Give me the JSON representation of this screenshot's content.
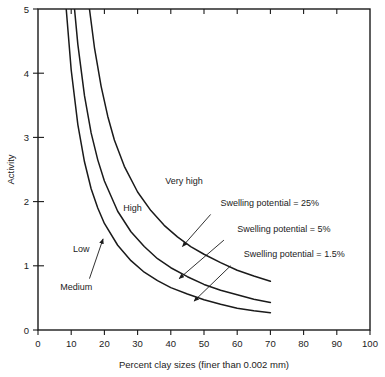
{
  "chart_data": {
    "type": "line",
    "title": "",
    "xlabel": "Percent clay sizes (finer than 0.002 mm)",
    "ylabel": "Activity",
    "xlim": [
      0,
      100
    ],
    "ylim": [
      0,
      5
    ],
    "xticks": [
      0,
      10,
      20,
      30,
      40,
      50,
      60,
      70,
      80,
      90,
      100
    ],
    "yticks": [
      0,
      1,
      2,
      3,
      4,
      5
    ],
    "grid": false,
    "legend_position": "none",
    "series": [
      {
        "name": "Swelling potential = 25%",
        "points": [
          {
            "x": 8.5,
            "y": 5.0
          },
          {
            "x": 10,
            "y": 4.05
          },
          {
            "x": 12,
            "y": 3.2
          },
          {
            "x": 14,
            "y": 2.62
          },
          {
            "x": 16,
            "y": 2.2
          },
          {
            "x": 18,
            "y": 1.9
          },
          {
            "x": 20,
            "y": 1.66
          },
          {
            "x": 24,
            "y": 1.32
          },
          {
            "x": 28,
            "y": 1.08
          },
          {
            "x": 32,
            "y": 0.9
          },
          {
            "x": 36,
            "y": 0.77
          },
          {
            "x": 40,
            "y": 0.66
          },
          {
            "x": 45,
            "y": 0.56
          },
          {
            "x": 50,
            "y": 0.47
          },
          {
            "x": 55,
            "y": 0.4
          },
          {
            "x": 60,
            "y": 0.34
          },
          {
            "x": 65,
            "y": 0.3
          },
          {
            "x": 70,
            "y": 0.27
          }
        ]
      },
      {
        "name": "Swelling potential = 5%",
        "points": [
          {
            "x": 11,
            "y": 5.0
          },
          {
            "x": 12,
            "y": 4.45
          },
          {
            "x": 14,
            "y": 3.65
          },
          {
            "x": 16,
            "y": 3.07
          },
          {
            "x": 18,
            "y": 2.65
          },
          {
            "x": 20,
            "y": 2.32
          },
          {
            "x": 24,
            "y": 1.85
          },
          {
            "x": 28,
            "y": 1.53
          },
          {
            "x": 32,
            "y": 1.3
          },
          {
            "x": 36,
            "y": 1.11
          },
          {
            "x": 40,
            "y": 0.97
          },
          {
            "x": 45,
            "y": 0.83
          },
          {
            "x": 50,
            "y": 0.71
          },
          {
            "x": 55,
            "y": 0.62
          },
          {
            "x": 60,
            "y": 0.55
          },
          {
            "x": 65,
            "y": 0.48
          },
          {
            "x": 70,
            "y": 0.43
          }
        ]
      },
      {
        "name": "Swelling potential = 1.5%",
        "points": [
          {
            "x": 15.5,
            "y": 5.0
          },
          {
            "x": 17,
            "y": 4.4
          },
          {
            "x": 19,
            "y": 3.8
          },
          {
            "x": 21,
            "y": 3.33
          },
          {
            "x": 23,
            "y": 2.96
          },
          {
            "x": 26,
            "y": 2.55
          },
          {
            "x": 30,
            "y": 2.15
          },
          {
            "x": 34,
            "y": 1.86
          },
          {
            "x": 38,
            "y": 1.63
          },
          {
            "x": 42,
            "y": 1.45
          },
          {
            "x": 46,
            "y": 1.3
          },
          {
            "x": 50,
            "y": 1.18
          },
          {
            "x": 55,
            "y": 1.05
          },
          {
            "x": 60,
            "y": 0.93
          },
          {
            "x": 65,
            "y": 0.84
          },
          {
            "x": 70,
            "y": 0.76
          }
        ]
      }
    ],
    "zone_labels": [
      {
        "text": "Very high",
        "x": 44,
        "y": 2.28
      },
      {
        "text": "High",
        "x": 28.5,
        "y": 1.85
      },
      {
        "text": "Low",
        "x": 13,
        "y": 1.22
      },
      {
        "text": "Medium",
        "x": 11.5,
        "y": 0.62
      }
    ],
    "annotations": [
      {
        "text": "Swelling potential = 25%",
        "x": 55,
        "y": 1.93
      },
      {
        "text": "Swelling potential = 5%",
        "x": 60,
        "y": 1.53
      },
      {
        "text": "Swelling potential = 1.5%",
        "x": 62,
        "y": 1.13
      }
    ],
    "colors": {
      "curve": "#1a1a1a",
      "axis": "#1a1a1a",
      "text": "#222222",
      "background": "#ffffff"
    }
  }
}
